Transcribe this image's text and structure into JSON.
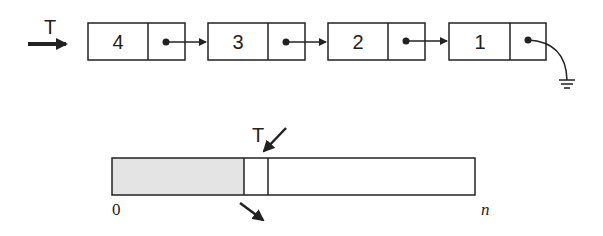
{
  "linked_list": {
    "head_label": "T",
    "nodes": [
      {
        "value": "4"
      },
      {
        "value": "3"
      },
      {
        "value": "2"
      },
      {
        "value": "1"
      }
    ],
    "terminator": "ground-icon"
  },
  "array": {
    "top_label": "T",
    "start_label": "0",
    "end_label": "n",
    "fill_color": "#e4e4e4",
    "stroke_color": "#222222"
  }
}
